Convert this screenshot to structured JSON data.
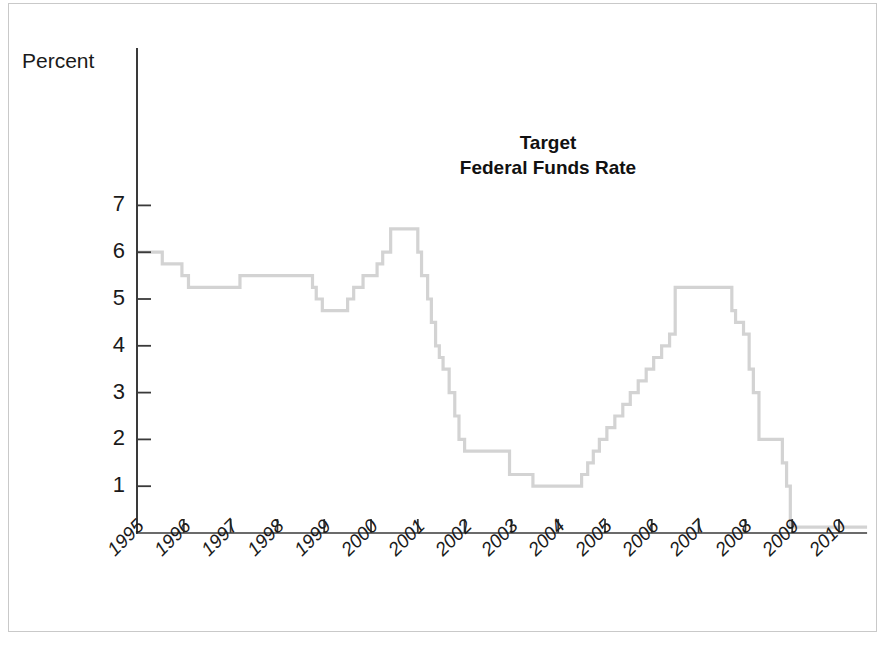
{
  "figure": {
    "title_line1": "Target",
    "title_line2": "Federal Funds Rate",
    "axis_caption": "Percent",
    "line_color": "#d3d3d3",
    "axis_color": "#3a3a3a",
    "frame_color": "#c9c9c9",
    "text_color": "#1a1a1a"
  },
  "chart_data": {
    "type": "line",
    "style": "step-post",
    "title": "Target Federal Funds Rate",
    "xlabel": "",
    "ylabel": "Percent",
    "ylim": [
      0,
      7
    ],
    "xlim": [
      1995,
      2010.6
    ],
    "grid": false,
    "legend": null,
    "ytick_labels": [
      "1",
      "2",
      "3",
      "4",
      "5",
      "6",
      "7"
    ],
    "ytick_values": [
      1,
      2,
      3,
      4,
      5,
      6,
      7
    ],
    "xtick_labels": [
      "1995",
      "1996",
      "1997",
      "1998",
      "1999",
      "2000",
      "2001",
      "2002",
      "2003",
      "2004",
      "2005",
      "2006",
      "2007",
      "2008",
      "2009",
      "2010"
    ],
    "xtick_values": [
      1995,
      1996,
      1997,
      1998,
      1999,
      2000,
      2001,
      2002,
      2003,
      2004,
      2005,
      2006,
      2007,
      2008,
      2009,
      2010
    ],
    "series": [
      {
        "name": "Target Federal Funds Rate",
        "color": "#d3d3d3",
        "x": [
          1995.0,
          1995.54,
          1995.96,
          1996.1,
          1997.2,
          1998.75,
          1998.83,
          1998.96,
          1999.5,
          1999.63,
          1999.83,
          2000.13,
          2000.25,
          2000.42,
          2001.0,
          2001.08,
          2001.21,
          2001.29,
          2001.38,
          2001.46,
          2001.54,
          2001.67,
          2001.79,
          2001.88,
          2002.0,
          2002.96,
          2003.46,
          2004.5,
          2004.63,
          2004.75,
          2004.88,
          2005.04,
          2005.21,
          2005.38,
          2005.54,
          2005.71,
          2005.88,
          2006.04,
          2006.21,
          2006.38,
          2006.5,
          2007.71,
          2007.79,
          2007.96,
          2008.08,
          2008.17,
          2008.29,
          2008.79,
          2008.88,
          2008.96,
          2010.6
        ],
        "y": [
          6.0,
          5.75,
          5.5,
          5.25,
          5.5,
          5.25,
          5.0,
          4.75,
          5.0,
          5.25,
          5.5,
          5.75,
          6.0,
          6.5,
          6.0,
          5.5,
          5.0,
          4.5,
          4.0,
          3.75,
          3.5,
          3.0,
          2.5,
          2.0,
          1.75,
          1.25,
          1.0,
          1.25,
          1.5,
          1.75,
          2.0,
          2.25,
          2.5,
          2.75,
          3.0,
          3.25,
          3.5,
          3.75,
          4.0,
          4.25,
          5.25,
          4.75,
          4.5,
          4.25,
          3.5,
          3.0,
          2.0,
          1.5,
          1.0,
          0.125,
          0.125
        ]
      }
    ],
    "annotations": [
      {
        "text": "Target Federal Funds Rate",
        "x": 2003.8,
        "y": 5.65
      }
    ]
  },
  "geometry": {
    "axis_x_origin_px": 137,
    "axis_y_bottom_px": 533,
    "axis_y_top_px": 48,
    "px_per_year": 46.8,
    "px_per_percent": 69.7
  }
}
